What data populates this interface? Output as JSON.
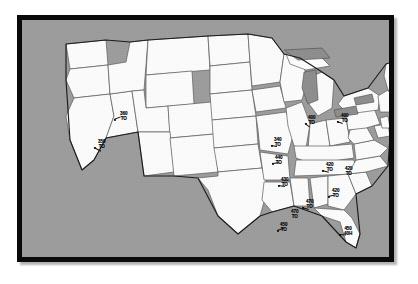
{
  "figure": {
    "background_color": "#9d9d9d",
    "border_color": "#0a0a0a",
    "land_color": "#fdfdfd",
    "state_border_color": "#5a5a5a",
    "lake_color": "#8e8e8e",
    "annotation_color": "#0d0d0d"
  },
  "annotations": [
    {
      "name": "annotation-utah-idaho",
      "value": "360",
      "unit": "TO",
      "x": 98,
      "y": 92
    },
    {
      "name": "annotation-nevada",
      "value": "350",
      "unit": "TO",
      "x": 76,
      "y": 120
    },
    {
      "name": "annotation-michigan-ohio",
      "value": "400",
      "unit": "TO",
      "x": 286,
      "y": 96
    },
    {
      "name": "annotation-new-york",
      "value": "400",
      "unit": "TO",
      "x": 319,
      "y": 94
    },
    {
      "name": "annotation-illinois",
      "value": "340",
      "unit": "TO",
      "x": 252,
      "y": 118
    },
    {
      "name": "annotation-indiana",
      "value": "440",
      "unit": "TO",
      "x": 253,
      "y": 136
    },
    {
      "name": "annotation-kentucky",
      "value": "430",
      "unit": "TO",
      "x": 259,
      "y": 158
    },
    {
      "name": "annotation-virginia",
      "value": "420",
      "unit": "TO",
      "x": 304,
      "y": 143
    },
    {
      "name": "annotation-north-carolina",
      "value": "420",
      "unit": "TO",
      "x": 323,
      "y": 147
    },
    {
      "name": "annotation-south-carolina",
      "value": "420",
      "unit": "TO",
      "x": 310,
      "y": 169
    },
    {
      "name": "annotation-georgia",
      "value": "470",
      "unit": "TO",
      "x": 284,
      "y": 180
    },
    {
      "name": "annotation-alabama",
      "value": "470",
      "unit": "TO",
      "x": 269,
      "y": 190
    },
    {
      "name": "annotation-louisiana",
      "value": "450",
      "unit": "TO",
      "x": 258,
      "y": 203
    },
    {
      "name": "annotation-florida",
      "value": "450",
      "unit": "40H",
      "x": 322,
      "y": 207
    }
  ],
  "leaders": [
    {
      "name": "leader-utah-idaho",
      "x": 92,
      "y": 99,
      "length": 7,
      "angle": -22
    },
    {
      "name": "leader-nevada",
      "x": 72,
      "y": 127,
      "length": 8,
      "angle": 28
    },
    {
      "name": "leader-michigan-ohio",
      "x": 283,
      "y": 103,
      "length": 6,
      "angle": 38
    },
    {
      "name": "leader-new-york",
      "x": 315,
      "y": 101,
      "length": 6,
      "angle": 20
    },
    {
      "name": "leader-illinois",
      "x": 249,
      "y": 125,
      "length": 6,
      "angle": 10
    },
    {
      "name": "leader-indiana",
      "x": 250,
      "y": 143,
      "length": 7,
      "angle": -6
    },
    {
      "name": "leader-kentucky",
      "x": 256,
      "y": 165,
      "length": 7,
      "angle": 8
    },
    {
      "name": "leader-virginia",
      "x": 300,
      "y": 150,
      "length": 7,
      "angle": 14
    },
    {
      "name": "leader-south-carolina",
      "x": 306,
      "y": 176,
      "length": 6,
      "angle": -12
    },
    {
      "name": "leader-georgia",
      "x": 280,
      "y": 187,
      "length": 7,
      "angle": 16
    },
    {
      "name": "leader-louisiana",
      "x": 255,
      "y": 210,
      "length": 7,
      "angle": -18
    },
    {
      "name": "leader-florida",
      "x": 317,
      "y": 214,
      "length": 7,
      "angle": 4
    }
  ]
}
